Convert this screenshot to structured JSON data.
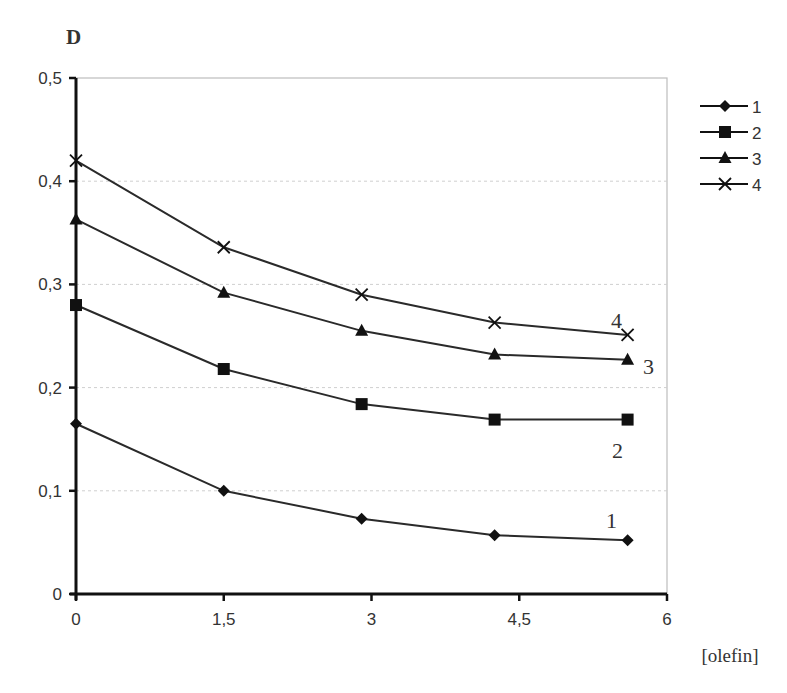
{
  "chart_data": {
    "type": "line",
    "title": "",
    "ylabel": "D",
    "xlabel": "[olefin]",
    "xlim": [
      0,
      6
    ],
    "ylim": [
      0,
      0.5
    ],
    "x_ticks": [
      "0",
      "1,5",
      "3",
      "4,5",
      "6"
    ],
    "y_ticks": [
      "0",
      "0,1",
      "0,2",
      "0,3",
      "0,4",
      "0,5"
    ],
    "grid": "horizontal dotted",
    "legend_position": "right",
    "x": [
      0,
      1.5,
      2.9,
      4.25,
      5.6
    ],
    "series": [
      {
        "name": "1",
        "marker": "diamond",
        "values": [
          0.165,
          0.1,
          0.073,
          0.057,
          0.052
        ]
      },
      {
        "name": "2",
        "marker": "square",
        "values": [
          0.28,
          0.218,
          0.184,
          0.169,
          0.169
        ]
      },
      {
        "name": "3",
        "marker": "triangle",
        "values": [
          0.363,
          0.292,
          0.255,
          0.232,
          0.227
        ]
      },
      {
        "name": "4",
        "marker": "cross",
        "values": [
          0.42,
          0.336,
          0.29,
          0.263,
          0.251
        ]
      }
    ],
    "annotations": [
      "1",
      "2",
      "3",
      "4"
    ]
  },
  "colors": {
    "line": "#2a2a2a",
    "grid": "#cfcfcf",
    "frame": "#bdbdbd"
  }
}
